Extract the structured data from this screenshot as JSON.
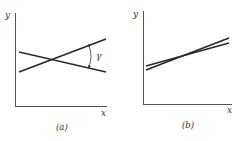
{
  "figure": {
    "panels": [
      {
        "id": "a",
        "caption": "(a)",
        "x_axis_label": "x",
        "y_axis_label": "y",
        "angle_label": "γ",
        "description": "Two lines intersecting at a substantial angle γ"
      },
      {
        "id": "b",
        "caption": "(b)",
        "x_axis_label": "x",
        "y_axis_label": "y",
        "description": "Two nearly parallel lines intersecting at a very small angle"
      }
    ],
    "colors": {
      "axis": "#555555",
      "line": "#2a2a2a",
      "text": "#333333"
    }
  }
}
